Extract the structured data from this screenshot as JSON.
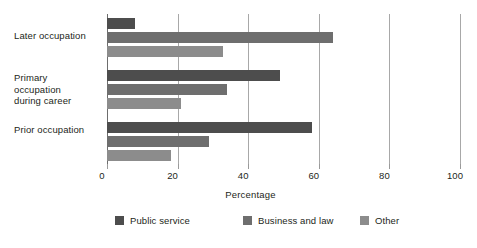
{
  "chart_data": {
    "type": "bar",
    "orientation": "horizontal",
    "title": "",
    "xlabel": "Percentage",
    "ylabel": "",
    "xlim": [
      0,
      100
    ],
    "xticks": [
      0,
      20,
      40,
      60,
      80,
      100
    ],
    "xtick_labels": [
      "0",
      "20",
      "40",
      "60",
      "80",
      "100"
    ],
    "grid": true,
    "grid_axis": "x",
    "legend_position": "bottom",
    "categories": [
      "Later occupation",
      "Primary occupation during career",
      "Prior occupation"
    ],
    "category_labels": [
      [
        "Later occupation"
      ],
      [
        "Primary occupation",
        "during career"
      ],
      [
        "Prior occupation"
      ]
    ],
    "series": [
      {
        "name": "Public service",
        "color": "#4d4d4d",
        "values": [
          8,
          49,
          58
        ]
      },
      {
        "name": "Business and law",
        "color": "#6e6e6e",
        "values": [
          64,
          34,
          29
        ]
      },
      {
        "name": "Other",
        "color": "#8c8c8c",
        "values": [
          33,
          21,
          18
        ]
      }
    ]
  },
  "legend": {
    "items": [
      {
        "label": "Public service",
        "color": "#4d4d4d"
      },
      {
        "label": "Business and law",
        "color": "#6e6e6e"
      },
      {
        "label": "Other",
        "color": "#8c8c8c"
      }
    ]
  },
  "axis": {
    "x_title": "Percentage"
  },
  "colors": {
    "background": "#ffffff",
    "text": "#231f20",
    "gridline": "#a8a8a8",
    "axis": "#6d6d6d"
  }
}
